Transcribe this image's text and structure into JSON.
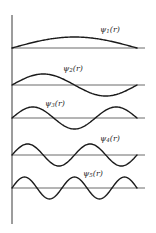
{
  "figure": {
    "axis": {
      "x": 12,
      "y_top": 15,
      "y_bottom": 224
    },
    "wave_x_start": 12,
    "wave_x_end": 137,
    "baseline_x_end": 145,
    "amplitude": 11,
    "colors": {
      "wave": "#1a1a1a",
      "baseline": "#6a6a6a",
      "axis": "#3a3a3a"
    },
    "waves": [
      {
        "n": 1,
        "baseline_y": 48,
        "label_symbol": "ψ",
        "label_sub": "1",
        "label_arg": "(r)",
        "label_x": 100,
        "label_y": 26
      },
      {
        "n": 2,
        "baseline_y": 85,
        "label_symbol": "ψ",
        "label_sub": "2",
        "label_arg": "(r)",
        "label_x": 63,
        "label_y": 65
      },
      {
        "n": 3,
        "baseline_y": 118,
        "label_symbol": "ψ",
        "label_sub": "3",
        "label_arg": "(r)",
        "label_x": 45,
        "label_y": 100
      },
      {
        "n": 4,
        "baseline_y": 155,
        "label_symbol": "ψ",
        "label_sub": "4",
        "label_arg": "(r)",
        "label_x": 100,
        "label_y": 135
      },
      {
        "n": 5,
        "baseline_y": 188,
        "label_symbol": "ψ",
        "label_sub": "5",
        "label_arg": "(r)",
        "label_x": 83,
        "label_y": 170
      }
    ]
  }
}
